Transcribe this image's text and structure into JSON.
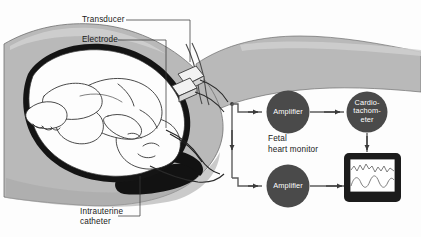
{
  "figure": {
    "background_color": "#fdfdfd"
  },
  "palette": {
    "body_gray": "#b9b9b9",
    "body_gray_light": "#cfcfcf",
    "uterus_outline": "#141414",
    "node_fill": "#4a4a4a",
    "node_text": "#ffffff",
    "line": "#5c5c5c",
    "monitor_frame": "#1c1c1c",
    "monitor_screen": "#ffffff",
    "trace": "#6f6f6f",
    "label_text": "#1a1a1a"
  },
  "labels": {
    "transducer": "Transducer",
    "electrode": "Electrode",
    "intrauterine_catheter_line1": "Intrauterine",
    "intrauterine_catheter_line2": "catheter",
    "fetal_monitor_line1": "Fetal",
    "fetal_monitor_line2": "heart monitor"
  },
  "nodes": {
    "amplifier_top": "Amplifier",
    "amplifier_bottom": "Amplifier",
    "cardiotachometer": "Cardio-\ntachom-\neter"
  },
  "monitor": {
    "traces": [
      {
        "name": "fetal-heart-rate-trace",
        "description": "jagged upper waveform"
      },
      {
        "name": "uterine-contraction-trace",
        "description": "smooth lower waveform"
      }
    ]
  },
  "icons": {
    "arrow_right": "arrow-right-icon",
    "arrow_down": "arrow-down-icon"
  }
}
